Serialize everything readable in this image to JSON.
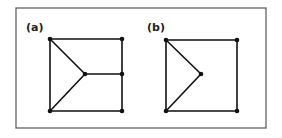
{
  "figure": {
    "frame": {
      "x": 16,
      "y": 8,
      "width": 250,
      "height": 120
    },
    "panels": [
      {
        "label": "(a)",
        "label_pos": {
          "x": 26,
          "y": 31
        },
        "nodes": [
          {
            "id": "tl",
            "x": 50,
            "y": 39
          },
          {
            "id": "tr",
            "x": 122,
            "y": 39
          },
          {
            "id": "c",
            "x": 85,
            "y": 74
          },
          {
            "id": "rm",
            "x": 122,
            "y": 74
          },
          {
            "id": "bl",
            "x": 50,
            "y": 111
          },
          {
            "id": "br",
            "x": 122,
            "y": 111
          }
        ],
        "edges": [
          [
            "tl",
            "tr"
          ],
          [
            "tr",
            "rm"
          ],
          [
            "rm",
            "br"
          ],
          [
            "br",
            "bl"
          ],
          [
            "bl",
            "tl"
          ],
          [
            "tl",
            "c"
          ],
          [
            "bl",
            "c"
          ],
          [
            "c",
            "rm"
          ]
        ]
      },
      {
        "label": "(b)",
        "label_pos": {
          "x": 147,
          "y": 31
        },
        "nodes": [
          {
            "id": "tl",
            "x": 166,
            "y": 40
          },
          {
            "id": "tr",
            "x": 237,
            "y": 40
          },
          {
            "id": "c",
            "x": 201,
            "y": 74
          },
          {
            "id": "bl",
            "x": 166,
            "y": 111
          },
          {
            "id": "br",
            "x": 237,
            "y": 111
          }
        ],
        "edges": [
          [
            "tl",
            "tr"
          ],
          [
            "tr",
            "br"
          ],
          [
            "br",
            "bl"
          ],
          [
            "bl",
            "tl"
          ],
          [
            "tl",
            "c"
          ],
          [
            "bl",
            "c"
          ]
        ]
      }
    ]
  }
}
